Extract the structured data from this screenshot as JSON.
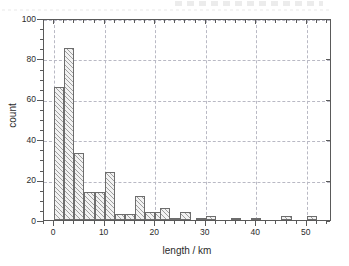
{
  "figure": {
    "kind": "histogram-figure",
    "background": "#ffffff",
    "frame_color": "#5a5a5a",
    "grid_color": "#b9b9c4",
    "bar_fill": "#f2f2f2",
    "bar_edge": "#6d6d6d",
    "hatch": "diagonal-45"
  },
  "chart_data": {
    "type": "bar",
    "title": "",
    "subtitle": "",
    "xlabel": "length / km",
    "ylabel": "count",
    "xlim": [
      -2,
      55
    ],
    "ylim": [
      0,
      100
    ],
    "xticks": [
      0,
      10,
      20,
      30,
      40,
      50
    ],
    "xtick_labels": [
      "0",
      "10",
      "20",
      "30",
      "40",
      "50"
    ],
    "xminor_step": 2,
    "yticks": [
      0,
      20,
      40,
      60,
      80,
      100
    ],
    "ytick_labels": [
      "0",
      "20",
      "40",
      "60",
      "80",
      "100"
    ],
    "yminor_step": 5,
    "grid": true,
    "grid_style": "dashed",
    "legend": null,
    "legend_position": "none",
    "bin_width": 2,
    "bin_edges": [
      0,
      2,
      4,
      6,
      8,
      10,
      12,
      14,
      16,
      18,
      20,
      22,
      24,
      26,
      28,
      30,
      32,
      34,
      36,
      38,
      40,
      42,
      44,
      46,
      48,
      50,
      52
    ],
    "categories": [
      "0-2",
      "2-4",
      "4-6",
      "6-8",
      "8-10",
      "10-12",
      "12-14",
      "14-16",
      "16-18",
      "18-20",
      "20-22",
      "22-24",
      "24-26",
      "26-28",
      "28-30",
      "30-32",
      "32-34",
      "34-36",
      "36-38",
      "38-40",
      "40-42",
      "42-44",
      "44-46",
      "46-48",
      "48-50",
      "50-52"
    ],
    "values": [
      66,
      85,
      33,
      14,
      14,
      24,
      3,
      3,
      12,
      4,
      4,
      6,
      1,
      4,
      1,
      2,
      0,
      1,
      1,
      0,
      1,
      0,
      0,
      2,
      0,
      2
    ],
    "bars": [
      {
        "x0": 0,
        "x1": 2,
        "value": 66
      },
      {
        "x0": 2,
        "x1": 4,
        "value": 85
      },
      {
        "x0": 4,
        "x1": 6,
        "value": 33
      },
      {
        "x0": 6,
        "x1": 8,
        "value": 14
      },
      {
        "x0": 8,
        "x1": 10,
        "value": 14
      },
      {
        "x0": 10,
        "x1": 12,
        "value": 24
      },
      {
        "x0": 12,
        "x1": 14,
        "value": 3
      },
      {
        "x0": 14,
        "x1": 16,
        "value": 3
      },
      {
        "x0": 16,
        "x1": 18,
        "value": 12
      },
      {
        "x0": 18,
        "x1": 20,
        "value": 4
      },
      {
        "x0": 20,
        "x1": 22,
        "value": 4
      },
      {
        "x0": 21,
        "x1": 23,
        "value": 6
      },
      {
        "x0": 23,
        "x1": 25,
        "value": 1
      },
      {
        "x0": 25,
        "x1": 27,
        "value": 4
      },
      {
        "x0": 28,
        "x1": 30,
        "value": 1
      },
      {
        "x0": 30,
        "x1": 32,
        "value": 2
      },
      {
        "x0": 35,
        "x1": 37,
        "value": 1
      },
      {
        "x0": 39,
        "x1": 41,
        "value": 1
      },
      {
        "x0": 45,
        "x1": 47,
        "value": 2
      },
      {
        "x0": 50,
        "x1": 52,
        "value": 2
      }
    ]
  }
}
